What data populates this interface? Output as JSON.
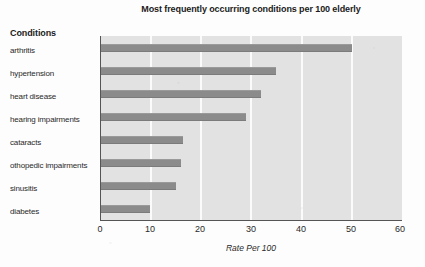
{
  "chart_data": {
    "type": "bar",
    "orientation": "horizontal",
    "title": "Most frequently occurring conditions per 100 elderly",
    "xlabel": "Rate Per 100",
    "ylabel": "Conditions",
    "xlim": [
      0,
      60
    ],
    "xticks": [
      0,
      10,
      20,
      30,
      40,
      50,
      60
    ],
    "xtick_labels": [
      "0",
      "10",
      "20",
      "30",
      "40",
      "50",
      "60"
    ],
    "grid": "vertical-white-gridlines",
    "legend": "none",
    "categories": [
      "arthritis",
      "hypertension",
      "heart disease",
      "hearing impairments",
      "cataracts",
      "othopedic impairments",
      "sinusitis",
      "diabetes"
    ],
    "values": [
      50,
      35,
      32,
      29,
      16.5,
      16,
      15,
      10
    ],
    "series": [
      {
        "name": "Rate Per 100",
        "values": [
          50,
          35,
          32,
          29,
          16.5,
          16,
          15,
          10
        ]
      }
    ]
  },
  "colors": {
    "bar": "#8b8b8b",
    "plot_background": "#e2e2e2",
    "gridline": "#fbfbfb",
    "axis": "#555555",
    "text": "#2a2a2a",
    "page_background": "#fdfdfd"
  }
}
